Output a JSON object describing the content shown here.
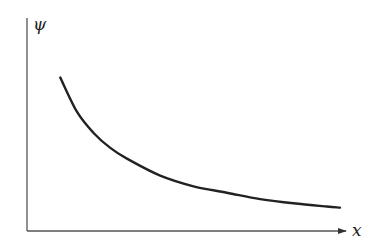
{
  "chart_data": {
    "type": "line",
    "title": "",
    "xlabel": "x",
    "ylabel": "ψ",
    "grid": false,
    "legend": null,
    "ticks": {
      "x": [],
      "y": []
    },
    "x_range": [
      0,
      10
    ],
    "y_range": [
      0,
      10
    ],
    "series": [
      {
        "name": "ψ(x)",
        "color": "#222222",
        "x": [
          1.0,
          1.5,
          2.0,
          2.5,
          3.0,
          4.0,
          5.0,
          6.0,
          7.0,
          8.0,
          9.0,
          9.4
        ],
        "y": [
          7.2,
          5.6,
          4.6,
          3.9,
          3.4,
          2.6,
          2.1,
          1.8,
          1.5,
          1.3,
          1.15,
          1.1
        ]
      }
    ]
  },
  "labels": {
    "y_axis": "ψ",
    "x_axis": "x"
  },
  "colors": {
    "axis": "#555555",
    "curve": "#222222",
    "background": "#ffffff"
  }
}
